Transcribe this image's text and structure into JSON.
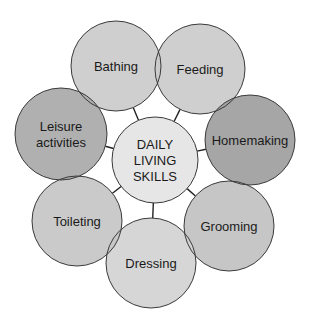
{
  "diagram": {
    "center": {
      "lines": [
        "DAILY",
        "LIVING",
        "SKILLS"
      ],
      "cx": 155,
      "cy": 160,
      "r": 43,
      "fill": "#e6e6e6"
    },
    "nodes": [
      {
        "id": "bathing",
        "lines": [
          "Bathing"
        ],
        "cx": 116,
        "cy": 66,
        "r": 45,
        "fill": "#cbcbcb"
      },
      {
        "id": "feeding",
        "lines": [
          "Feeding"
        ],
        "cx": 200,
        "cy": 69,
        "r": 45,
        "fill": "#cbcbcb"
      },
      {
        "id": "homemaking",
        "lines": [
          "Homemaking"
        ],
        "cx": 250,
        "cy": 140,
        "r": 45,
        "fill": "#9e9e9e"
      },
      {
        "id": "grooming",
        "lines": [
          "Grooming"
        ],
        "cx": 229,
        "cy": 226,
        "r": 45,
        "fill": "#c1c1c1"
      },
      {
        "id": "dressing",
        "lines": [
          "Dressing"
        ],
        "cx": 151,
        "cy": 263,
        "r": 45,
        "fill": "#d3d3d3"
      },
      {
        "id": "toileting",
        "lines": [
          "Toileting"
        ],
        "cx": 77,
        "cy": 221,
        "r": 45,
        "fill": "#c6c6c6"
      },
      {
        "id": "leisure-activities",
        "lines": [
          "Leisure",
          "activities"
        ],
        "cx": 61,
        "cy": 134,
        "r": 46,
        "fill": "#a9a9a9"
      }
    ],
    "stroke_color": "#3a3a3a",
    "connector_color": "#222222"
  }
}
